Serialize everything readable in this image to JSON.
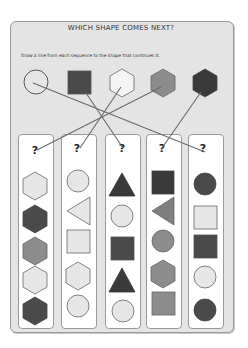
{
  "worksheet": {
    "title": "WHICH SHAPE COMES NEXT?",
    "instruction": "Draw a line from each sequence to the shape that continues it."
  },
  "colors": {
    "panel": "#e4e4e4",
    "light": "#e6e6e6",
    "mid": "#8c8c8c",
    "dark": "#4a4a4a",
    "darker": "#3a3a3a",
    "stroke": "#555555",
    "line": "#6a6a6a"
  },
  "answer_options": [
    {
      "shape": "circle",
      "fill": "light",
      "label": "light circle"
    },
    {
      "shape": "square",
      "fill": "dark",
      "label": "dark square"
    },
    {
      "shape": "hexagon",
      "fill": "white",
      "label": "white hexagon"
    },
    {
      "shape": "hexagon",
      "fill": "mid",
      "label": "gray hexagon"
    },
    {
      "shape": "hexagon",
      "fill": "darker",
      "label": "dark hexagon"
    }
  ],
  "sequences": [
    {
      "question": "?",
      "shapes": [
        {
          "shape": "hexagon",
          "fill": "light"
        },
        {
          "shape": "hexagon",
          "fill": "dark"
        },
        {
          "shape": "hexagon",
          "fill": "mid"
        },
        {
          "shape": "hexagon",
          "fill": "light"
        },
        {
          "shape": "hexagon",
          "fill": "dark"
        }
      ]
    },
    {
      "question": "?",
      "shapes": [
        {
          "shape": "circle",
          "fill": "light"
        },
        {
          "shape": "triangle-left",
          "fill": "light"
        },
        {
          "shape": "square",
          "fill": "light"
        },
        {
          "shape": "hexagon",
          "fill": "light"
        },
        {
          "shape": "circle",
          "fill": "light"
        }
      ]
    },
    {
      "question": "?",
      "shapes": [
        {
          "shape": "triangle",
          "fill": "darker"
        },
        {
          "shape": "circle",
          "fill": "light"
        },
        {
          "shape": "square",
          "fill": "dark"
        },
        {
          "shape": "triangle",
          "fill": "darker"
        },
        {
          "shape": "circle",
          "fill": "light"
        }
      ]
    },
    {
      "question": "?",
      "shapes": [
        {
          "shape": "square",
          "fill": "darker"
        },
        {
          "shape": "triangle-left",
          "fill": "mid"
        },
        {
          "shape": "circle",
          "fill": "mid"
        },
        {
          "shape": "hexagon",
          "fill": "mid"
        },
        {
          "shape": "square",
          "fill": "mid"
        }
      ]
    },
    {
      "question": "?",
      "shapes": [
        {
          "shape": "circle",
          "fill": "dark"
        },
        {
          "shape": "square",
          "fill": "light"
        },
        {
          "shape": "square",
          "fill": "dark"
        },
        {
          "shape": "circle",
          "fill": "light"
        },
        {
          "shape": "circle",
          "fill": "dark"
        }
      ]
    }
  ],
  "connections": [
    {
      "from_option": 0,
      "to_sequence": 4
    },
    {
      "from_option": 1,
      "to_sequence": 2
    },
    {
      "from_option": 2,
      "to_sequence": 1
    },
    {
      "from_option": 3,
      "to_sequence": 0
    },
    {
      "from_option": 4,
      "to_sequence": 3
    }
  ]
}
